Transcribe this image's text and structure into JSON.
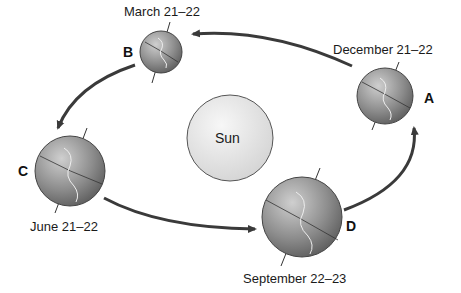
{
  "diagram": {
    "title": "",
    "center": {
      "label": "Sun",
      "fill": "#e6e6e6"
    },
    "positions": [
      {
        "letter": "A",
        "date": "December 21–22"
      },
      {
        "letter": "B",
        "date": "March 21–22"
      },
      {
        "letter": "C",
        "date": "June 21–22"
      },
      {
        "letter": "D",
        "date": "September 22–23"
      }
    ],
    "orbit_direction": "counterclockwise (A → B → C → D → A)",
    "colors": {
      "arrow": "#3a3a3a",
      "earth": "#8a8a8a",
      "sun": "#e6e6e6"
    }
  }
}
